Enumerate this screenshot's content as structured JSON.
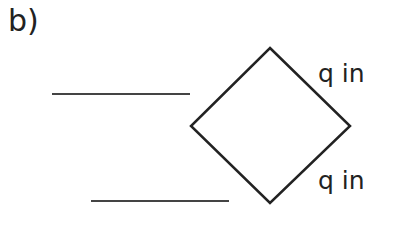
{
  "part_label": "b)",
  "diagram": {
    "shape": "square rotated 45° (diamond)",
    "side_labels": [
      {
        "position": "upper-right side",
        "text": "q in"
      },
      {
        "position": "lower-right side",
        "text": "q in"
      }
    ],
    "answer_blanks": [
      {
        "position": "upper-left",
        "text": ""
      },
      {
        "position": "lower-left",
        "text": ""
      }
    ],
    "stroke_color": "#222222"
  }
}
